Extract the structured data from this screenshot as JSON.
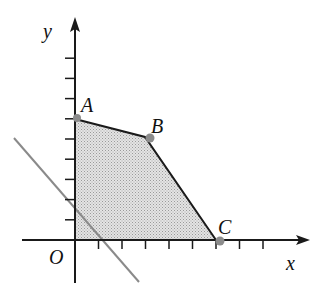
{
  "diagram": {
    "type": "linear-programming-feasible-region",
    "axes": {
      "x_label": "x",
      "y_label": "y",
      "origin_label": "O",
      "x_ticks": [
        1,
        2,
        3,
        4,
        5,
        6,
        7,
        8
      ],
      "y_ticks": [
        1,
        2,
        3,
        4,
        5,
        6,
        7,
        8,
        9
      ]
    },
    "points": [
      {
        "label": "A",
        "x": 0,
        "y": 6
      },
      {
        "label": "B",
        "x": 3,
        "y": 5
      },
      {
        "label": "C",
        "x": 6,
        "y": 0
      },
      {
        "label": "O",
        "x": 0,
        "y": 0
      }
    ],
    "feasible_region": {
      "vertices": [
        "O",
        "A",
        "B",
        "C"
      ],
      "fill": "#cfcfcf"
    },
    "objective_line": {
      "description": "gray line with negative slope through region near origin",
      "color": "#8a8a8a",
      "intercepts": {
        "x": 1.15,
        "y": 1.6
      }
    },
    "colors": {
      "axis": "#1a1a1a",
      "boundary": "#1a1a1a",
      "vertex_dot": "#8c8c8c"
    }
  }
}
